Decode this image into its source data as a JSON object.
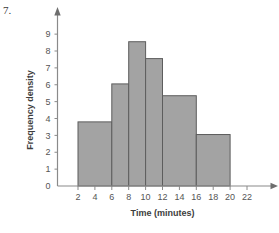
{
  "question": {
    "number_label": "7."
  },
  "chart_data": {
    "type": "bar",
    "title": "",
    "subtitle": "",
    "xlabel": "Time (minutes)",
    "ylabel": "Frequency density",
    "xlim": [
      0,
      23
    ],
    "ylim": [
      0,
      9.6
    ],
    "grid": false,
    "legend": null,
    "x_ticks": [
      2,
      4,
      6,
      8,
      10,
      12,
      14,
      16,
      18,
      20,
      22
    ],
    "x_tick_labels": [
      "2",
      "4",
      "6",
      "8",
      "10",
      "12",
      "14",
      "16",
      "18",
      "20",
      "22"
    ],
    "y_ticks": [
      0,
      1,
      2,
      3,
      4,
      5,
      6,
      7,
      8,
      9
    ],
    "y_tick_labels": [
      "0",
      "1",
      "2",
      "3",
      "4",
      "5",
      "6",
      "7",
      "8",
      "9"
    ],
    "bar_fill_color": "#a3a3a3",
    "bar_edge_color": "#5d5d5d",
    "axis_color": "#8a8a8a",
    "bins": [
      {
        "label": "2-6",
        "x_start": 2,
        "x_end": 6,
        "frequency_density": 3.8
      },
      {
        "label": "6-8",
        "x_start": 6,
        "x_end": 8,
        "frequency_density": 6.05
      },
      {
        "label": "8-10",
        "x_start": 8,
        "x_end": 10,
        "frequency_density": 8.55
      },
      {
        "label": "10-12",
        "x_start": 10,
        "x_end": 12,
        "frequency_density": 7.55
      },
      {
        "label": "12-16",
        "x_start": 12,
        "x_end": 16,
        "frequency_density": 5.35
      },
      {
        "label": "16-20",
        "x_start": 16,
        "x_end": 20,
        "frequency_density": 3.05
      }
    ]
  }
}
